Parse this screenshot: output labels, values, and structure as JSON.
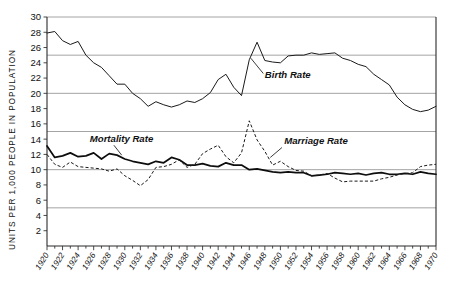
{
  "chart_data": {
    "type": "line",
    "title": "",
    "subtitle": "",
    "xlabel": "",
    "ylabel": "UNITS PER 1,000 PEOPLE IN POPULATION",
    "xlim": [
      1920,
      1970
    ],
    "ylim": [
      0,
      30
    ],
    "grid": true,
    "grid_values": [
      5,
      10,
      15,
      20,
      25,
      30
    ],
    "legend_position": "inline-annotations",
    "y_ticks": [
      2,
      4,
      6,
      8,
      10,
      12,
      14,
      16,
      18,
      20,
      22,
      24,
      26,
      28,
      30
    ],
    "y_tick_labels": [
      "2",
      "4",
      "6",
      "8",
      "10",
      "12",
      "14",
      "16",
      "18",
      "20",
      "22",
      "24",
      "26",
      "28",
      "30"
    ],
    "x_ticks": [
      1920,
      1922,
      1924,
      1926,
      1928,
      1930,
      1932,
      1934,
      1936,
      1938,
      1940,
      1942,
      1944,
      1946,
      1948,
      1950,
      1952,
      1954,
      1956,
      1958,
      1960,
      1962,
      1964,
      1966,
      1968,
      1970
    ],
    "x_tick_labels": [
      "1920",
      "1922",
      "1924",
      "1926",
      "1928",
      "1930",
      "1932",
      "1934",
      "1936",
      "1938",
      "1940",
      "1942",
      "1944",
      "1946",
      "1948",
      "1950",
      "1952",
      "1954",
      "1956",
      "1958",
      "1960",
      "1962",
      "1964",
      "1966",
      "1968",
      "1970"
    ],
    "x_minor_ticks": [
      1921,
      1923,
      1925,
      1927,
      1929,
      1931,
      1933,
      1935,
      1937,
      1939,
      1941,
      1943,
      1945,
      1947,
      1949,
      1951,
      1953,
      1955,
      1957,
      1959,
      1961,
      1963,
      1965,
      1967,
      1969
    ],
    "x": [
      1920,
      1921,
      1922,
      1923,
      1924,
      1925,
      1926,
      1927,
      1928,
      1929,
      1930,
      1931,
      1932,
      1933,
      1934,
      1935,
      1936,
      1937,
      1938,
      1939,
      1940,
      1941,
      1942,
      1943,
      1944,
      1945,
      1946,
      1947,
      1948,
      1949,
      1950,
      1951,
      1952,
      1953,
      1954,
      1955,
      1956,
      1957,
      1958,
      1959,
      1960,
      1961,
      1962,
      1963,
      1964,
      1965,
      1966,
      1967,
      1968,
      1969,
      1970
    ],
    "series": [
      {
        "name": "Birth Rate",
        "style": "solid-thin",
        "color": "#1a1a1a",
        "values": [
          27.9,
          28.1,
          26.9,
          26.4,
          26.8,
          25.0,
          24.0,
          23.4,
          22.3,
          21.2,
          21.2,
          20.0,
          19.3,
          18.3,
          18.9,
          18.5,
          18.2,
          18.5,
          19.0,
          18.8,
          19.3,
          20.1,
          21.8,
          22.5,
          20.8,
          19.7,
          24.4,
          26.7,
          24.3,
          24.1,
          24.0,
          24.9,
          25.0,
          25.0,
          25.3,
          25.1,
          25.2,
          25.3,
          24.6,
          24.3,
          23.8,
          23.5,
          22.5,
          21.8,
          21.1,
          19.5,
          18.5,
          17.9,
          17.6,
          17.8,
          18.3
        ]
      },
      {
        "name": "Mortality Rate",
        "style": "solid-thick",
        "color": "#0d0d0d",
        "values": [
          13.1,
          11.6,
          11.8,
          12.2,
          11.7,
          11.8,
          12.2,
          11.4,
          12.1,
          11.9,
          11.4,
          11.1,
          10.9,
          10.7,
          11.1,
          10.9,
          11.6,
          11.3,
          10.6,
          10.6,
          10.8,
          10.5,
          10.4,
          10.9,
          10.6,
          10.6,
          10.0,
          10.1,
          9.9,
          9.7,
          9.6,
          9.7,
          9.6,
          9.6,
          9.2,
          9.3,
          9.4,
          9.6,
          9.5,
          9.4,
          9.5,
          9.3,
          9.5,
          9.6,
          9.4,
          9.4,
          9.5,
          9.4,
          9.7,
          9.5,
          9.4
        ]
      },
      {
        "name": "Marriage Rate",
        "style": "dashed",
        "color": "#1a1a1a",
        "values": [
          12.0,
          10.7,
          10.3,
          11.0,
          10.4,
          10.3,
          10.2,
          10.1,
          9.8,
          10.1,
          9.2,
          8.6,
          7.9,
          8.7,
          10.3,
          10.4,
          10.7,
          11.3,
          10.3,
          10.7,
          12.1,
          12.7,
          13.2,
          11.7,
          10.9,
          12.2,
          16.4,
          13.9,
          12.4,
          10.6,
          11.1,
          10.4,
          9.9,
          9.8,
          9.2,
          9.3,
          9.5,
          8.9,
          8.4,
          8.5,
          8.5,
          8.5,
          8.5,
          8.8,
          9.0,
          9.3,
          9.5,
          9.6,
          10.4,
          10.6,
          10.7
        ]
      }
    ],
    "annotations": [
      {
        "text": "Birth Rate",
        "at_x": 1948,
        "at_y": 22.0
      },
      {
        "text": "Mortality Rate",
        "at_x": 1925.5,
        "at_y": 13.6
      },
      {
        "text": "Marriage Rate",
        "at_x": 1950.5,
        "at_y": 13.3
      }
    ]
  }
}
